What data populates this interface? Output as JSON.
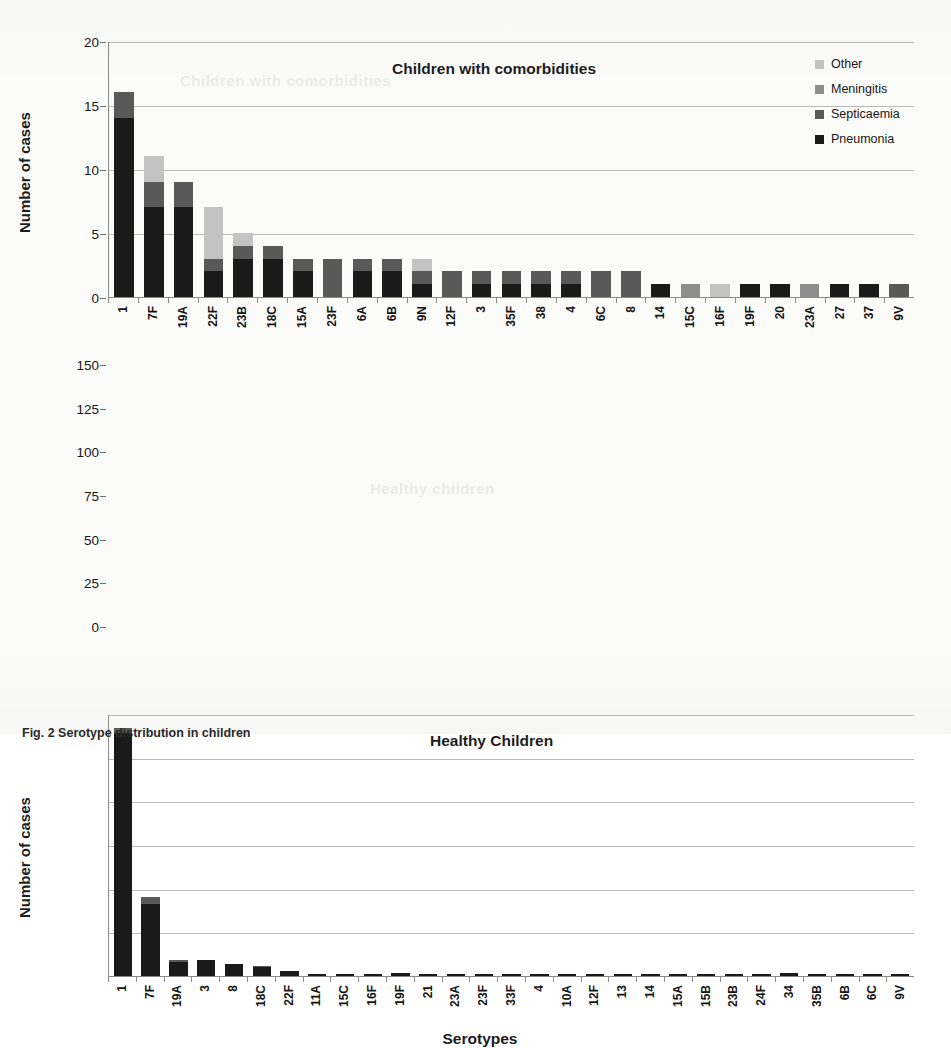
{
  "figure": {
    "caption": "Fig. 2 Serotype distribution in children",
    "xlabel": "Serotypes",
    "ylabel": "Number of cases",
    "watermark_top": "Children with comorbidities",
    "watermark_mid": "Healthy children"
  },
  "legend": {
    "position": "top-right",
    "items": [
      {
        "label": "Other",
        "color": "#c3c3c3",
        "key": "other"
      },
      {
        "label": "Meningitis",
        "color": "#8d8d8d",
        "key": "meningitis"
      },
      {
        "label": "Septicaemia",
        "color": "#595959",
        "key": "septicaemia"
      },
      {
        "label": "Pneumonia",
        "color": "#1a1a1a",
        "key": "pneumonia"
      }
    ]
  },
  "chart_data": [
    {
      "type": "bar",
      "stacked": true,
      "title": "Children with comorbidities",
      "xlabel": "",
      "ylabel": "Number of cases",
      "ylim": [
        0,
        20
      ],
      "yticks": [
        0,
        5,
        10,
        15,
        20
      ],
      "grid": true,
      "legend_position": "top-right",
      "categories": [
        "1",
        "7F",
        "19A",
        "22F",
        "23B",
        "18C",
        "15A",
        "23F",
        "6A",
        "6B",
        "9N",
        "12F",
        "3",
        "35F",
        "38",
        "4",
        "6C",
        "8",
        "14",
        "15C",
        "16F",
        "19F",
        "20",
        "23A",
        "27",
        "37",
        "9V"
      ],
      "series": [
        {
          "name": "Pneumonia",
          "color": "#1a1a1a",
          "values": [
            14,
            7,
            7,
            2,
            3,
            3,
            2,
            0,
            2,
            2,
            1,
            0,
            1,
            1,
            1,
            1,
            0,
            0,
            1,
            0,
            0,
            1,
            1,
            0,
            1,
            1,
            0
          ]
        },
        {
          "name": "Septicaemia",
          "color": "#595959",
          "values": [
            2,
            2,
            2,
            1,
            1,
            1,
            1,
            3,
            1,
            1,
            1,
            2,
            1,
            1,
            1,
            1,
            2,
            2,
            0,
            0,
            0,
            0,
            0,
            0,
            0,
            0,
            1
          ]
        },
        {
          "name": "Meningitis",
          "color": "#8d8d8d",
          "values": [
            0,
            0,
            0,
            0,
            0,
            0,
            0,
            0,
            0,
            0,
            0,
            0,
            0,
            0,
            0,
            0,
            0,
            0,
            0,
            1,
            0,
            0,
            0,
            1,
            0,
            0,
            0
          ]
        },
        {
          "name": "Other",
          "color": "#c3c3c3",
          "values": [
            0,
            2,
            0,
            4,
            1,
            0,
            0,
            0,
            0,
            0,
            1,
            0,
            0,
            0,
            0,
            0,
            0,
            0,
            0,
            0,
            1,
            0,
            0,
            0,
            0,
            0,
            0
          ]
        }
      ],
      "totals": [
        16,
        11,
        9,
        7,
        5,
        4,
        3,
        3,
        3,
        3,
        3,
        2,
        2,
        2,
        2,
        2,
        2,
        2,
        1,
        1,
        1,
        1,
        1,
        1,
        1,
        1,
        1
      ]
    },
    {
      "type": "bar",
      "stacked": true,
      "title": "Healthy Children",
      "xlabel": "Serotypes",
      "ylabel": "Number of cases",
      "ylim": [
        0,
        150
      ],
      "yticks": [
        0,
        25,
        50,
        75,
        100,
        125,
        150
      ],
      "grid": true,
      "legend_position": "none",
      "categories": [
        "1",
        "7F",
        "19A",
        "3",
        "8",
        "18C",
        "22F",
        "11A",
        "15C",
        "16F",
        "19F",
        "21",
        "23A",
        "23F",
        "33F",
        "4",
        "10A",
        "12F",
        "13",
        "14",
        "15A",
        "15B",
        "23B",
        "24F",
        "34",
        "35B",
        "6B",
        "6C",
        "9V"
      ],
      "series": [
        {
          "name": "Pneumonia",
          "color": "#1a1a1a",
          "values": [
            139,
            41,
            8,
            9,
            7,
            5,
            3,
            1,
            1,
            1,
            2,
            1,
            1,
            1,
            1,
            1,
            1,
            1,
            1,
            1,
            1,
            1,
            1,
            1,
            2,
            1,
            1,
            1,
            1
          ]
        },
        {
          "name": "Septicaemia",
          "color": "#595959",
          "values": [
            3,
            4,
            1,
            0,
            0,
            1,
            0,
            0,
            0,
            0,
            0,
            0,
            0,
            0,
            0,
            0,
            0,
            0,
            0,
            0,
            0,
            0,
            0,
            0,
            0,
            0,
            0,
            0,
            0
          ]
        },
        {
          "name": "Meningitis",
          "color": "#8d8d8d",
          "values": [
            0,
            0,
            0,
            0,
            0,
            0,
            0,
            0,
            0,
            0,
            0,
            0,
            0,
            0,
            0,
            0,
            0,
            0,
            0,
            0,
            0,
            0,
            0,
            0,
            0,
            0,
            0,
            0,
            0
          ]
        },
        {
          "name": "Other",
          "color": "#c3c3c3",
          "values": [
            0,
            0,
            0,
            0,
            0,
            0,
            0,
            0,
            0,
            0,
            0,
            0,
            0,
            0,
            0,
            0,
            0,
            0,
            0,
            0,
            0,
            0,
            0,
            0,
            0,
            0,
            0,
            0,
            0
          ]
        }
      ],
      "totals": [
        142,
        45,
        9,
        9,
        7,
        6,
        3,
        1,
        1,
        1,
        2,
        1,
        1,
        1,
        1,
        1,
        1,
        1,
        1,
        1,
        1,
        1,
        1,
        1,
        2,
        1,
        1,
        1,
        1
      ]
    }
  ]
}
